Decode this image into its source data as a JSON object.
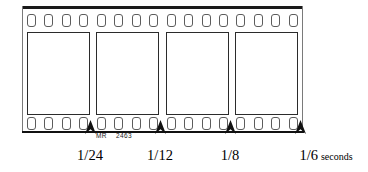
{
  "figure": {
    "type": "film-strip-timeline-diagram",
    "filmstrip": {
      "sprocket_holes_top": 16,
      "sprocket_holes_bottom": 16,
      "frames_count": 4,
      "edge_marking": {
        "manufacturer": "MR",
        "code": "2463"
      }
    },
    "timeline": {
      "ticks": [
        {
          "label": "1/24",
          "unit": "",
          "x": 90
        },
        {
          "label": "1/12",
          "unit": "",
          "x": 160
        },
        {
          "label": "1/8",
          "unit": "",
          "x": 230
        },
        {
          "label": "1/6",
          "unit": "seconds",
          "x": 300
        }
      ]
    },
    "colors": {
      "ink": "#111111",
      "frame_border": "#2b2b2b",
      "hole_border": "#5c5c5c",
      "paper": "#ffffff"
    }
  }
}
